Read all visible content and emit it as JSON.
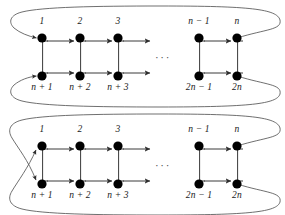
{
  "figure": {
    "type": "directed-graph-diagram",
    "background_color": "#ffffff",
    "node_color": "#000000",
    "edge_color": "#3a3a3a",
    "wrap_curve_color": "#555555",
    "label_color": "#1a1a1a",
    "ellipsis": "···"
  },
  "layout": {
    "columns_x": [
      42,
      80,
      118,
      199,
      237
    ],
    "top_row_y": 38,
    "bottom_row_y": 76,
    "top_label_y": 16,
    "bottom_label_y": 82,
    "ellipsis_x": 160,
    "node_radius": 4.6
  },
  "diagrams": [
    {
      "id": "diagram-top",
      "name": "non-crossing-wrap",
      "wrap_style": "parallel",
      "top_labels": [
        "1",
        "2",
        "3",
        "n − 1",
        "n"
      ],
      "bottom_labels": [
        "n + 1",
        "n + 2",
        "n + 3",
        "2n − 1",
        "2n"
      ],
      "ellipsis": "···"
    },
    {
      "id": "diagram-bottom",
      "name": "crossing-wrap",
      "wrap_style": "crossed",
      "top_labels": [
        "1",
        "2",
        "3",
        "n − 1",
        "n"
      ],
      "bottom_labels": [
        "n + 1",
        "n + 2",
        "n + 3",
        "2n − 1",
        "2n"
      ],
      "ellipsis": "···"
    }
  ]
}
